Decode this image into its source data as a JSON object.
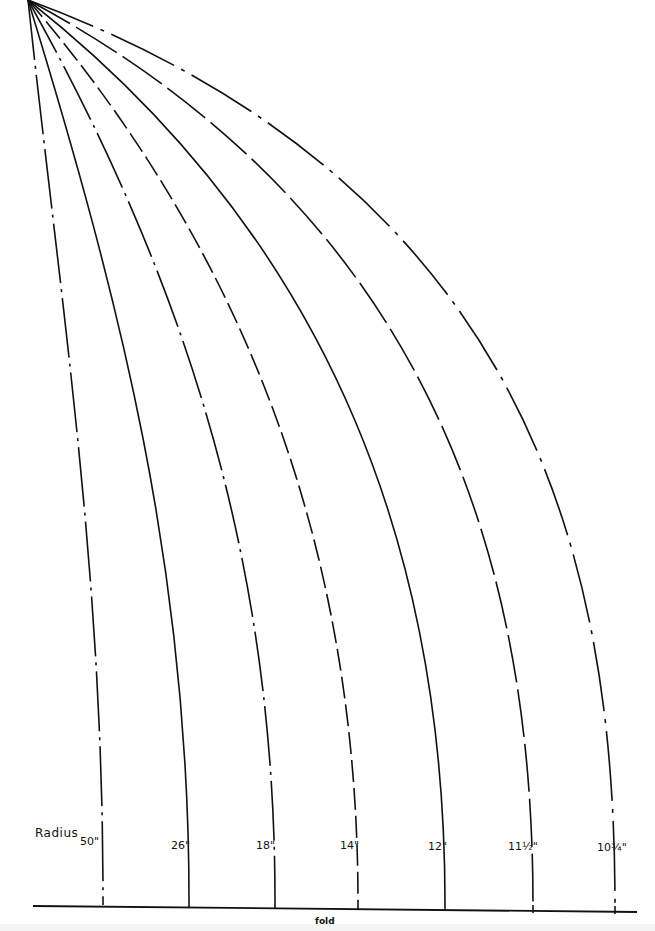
{
  "diagram": {
    "title_label": "Radius",
    "baseline_label": "fold",
    "apex": {
      "x": 28,
      "y": 0
    },
    "baseline": {
      "x1": 33,
      "y1": 906,
      "x2": 637,
      "y2": 912
    },
    "curves": [
      {
        "label": "50\"",
        "end_x": 103,
        "end_y": 897,
        "style": "dash-dot",
        "ctrl": [
          60,
          300
        ]
      },
      {
        "label": "26\"",
        "end_x": 189,
        "end_y": 899,
        "style": "solid",
        "ctrl": [
          120,
          300
        ]
      },
      {
        "label": "18\"",
        "end_x": 275,
        "end_y": 900,
        "style": "dash-dot",
        "ctrl": [
          190,
          290
        ]
      },
      {
        "label": "14\"",
        "end_x": 358,
        "end_y": 902,
        "style": "dashed",
        "ctrl": [
          260,
          270
        ]
      },
      {
        "label": "12\"",
        "end_x": 445,
        "end_y": 903,
        "style": "solid",
        "ctrl": [
          345,
          250
        ]
      },
      {
        "label": "11½\"",
        "end_x": 533,
        "end_y": 905,
        "style": "long-dash",
        "ctrl": [
          440,
          220
        ]
      },
      {
        "label": "10¾\"",
        "end_x": 615,
        "end_y": 906,
        "style": "long-dash-gap",
        "ctrl": [
          540,
          190
        ]
      }
    ],
    "stroke_color": "#111111",
    "background_color": "#ffffff"
  }
}
